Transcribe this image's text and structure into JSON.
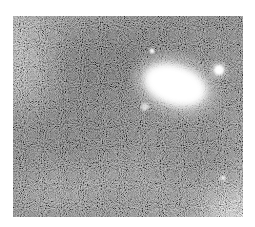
{
  "image": {
    "subject": "astronomical photograph of a galaxy with field stars",
    "rendering": "grayscale, heavy grain noise",
    "colors": {
      "background": "#ffffff",
      "sky_dark": "#4a4a4a",
      "sky_mid": "#7a7a7a",
      "sky_light": "#bdbdbd",
      "core": "#ffffff"
    },
    "features": [
      {
        "name": "galaxy",
        "cx": 162,
        "cy": 69,
        "rx": 32,
        "ry": 20,
        "rotate": 18
      },
      {
        "name": "bright-star",
        "cx": 206,
        "cy": 54,
        "r": 6
      },
      {
        "name": "small-star-top",
        "cx": 139,
        "cy": 35,
        "r": 2.5
      },
      {
        "name": "companion-blob",
        "cx": 132,
        "cy": 91,
        "r": 4
      },
      {
        "name": "faint-star-lower-right",
        "cx": 210,
        "cy": 162,
        "r": 2.5
      }
    ]
  }
}
